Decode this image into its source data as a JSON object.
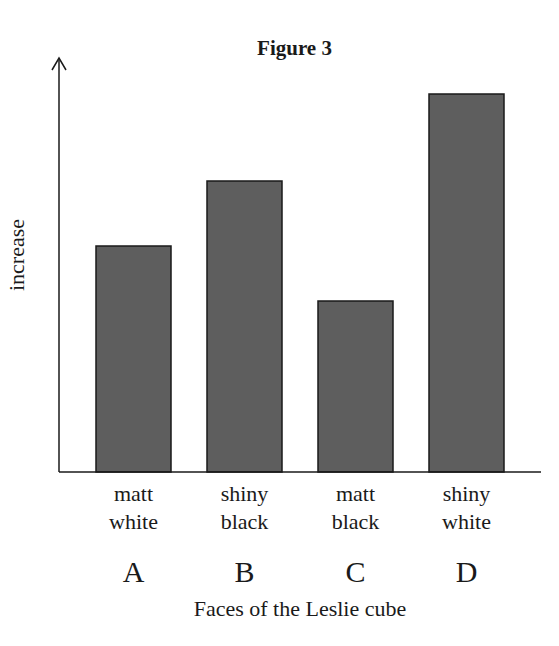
{
  "chart_data": {
    "type": "bar",
    "title": "Figure 3",
    "xlabel": "Faces of the Leslie cube",
    "ylabel": "increase",
    "categories": [
      "A",
      "B",
      "C",
      "D"
    ],
    "category_descriptions": [
      "matt white",
      "shiny black",
      "matt black",
      "shiny white"
    ],
    "values": [
      226,
      291,
      171,
      378
    ],
    "value_units": "relative (no numeric scale shown)",
    "ylim": [
      0,
      410
    ],
    "grid": false,
    "legend": null,
    "bar_color": "#5e5e5e",
    "bar_edge_color": "#1a1a1a"
  },
  "labels": {
    "title": "Figure 3",
    "ylabel": "increase",
    "xlabel": "Faces of the Leslie cube",
    "bars": [
      {
        "letter": "A",
        "line1": "matt",
        "line2": "white"
      },
      {
        "letter": "B",
        "line1": "shiny",
        "line2": "black"
      },
      {
        "letter": "C",
        "line1": "matt",
        "line2": "black"
      },
      {
        "letter": "D",
        "line1": "shiny",
        "line2": "white"
      }
    ]
  }
}
